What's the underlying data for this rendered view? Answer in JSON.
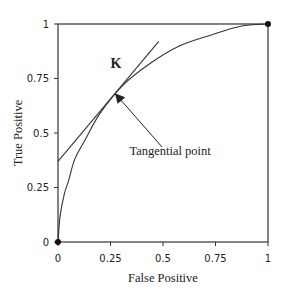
{
  "chart_data": {
    "type": "line",
    "title": "",
    "xlabel": "False Positive",
    "ylabel": "True Positive",
    "xlim": [
      0,
      1
    ],
    "ylim": [
      0,
      1
    ],
    "grid": false,
    "legend": null,
    "xticks": [
      "0",
      "0.25",
      "0.5",
      "0.75",
      "1"
    ],
    "yticks": [
      "0",
      "0.25",
      "0.5",
      "0.75",
      "1"
    ],
    "series": [
      {
        "name": "ROC curve",
        "x": [
          0,
          0.01,
          0.03,
          0.05,
          0.08,
          0.13,
          0.2,
          0.31,
          0.44,
          0.58,
          0.73,
          0.87,
          1.0
        ],
        "y": [
          0,
          0.12,
          0.22,
          0.28,
          0.38,
          0.47,
          0.59,
          0.72,
          0.82,
          0.9,
          0.95,
          0.99,
          1.0
        ]
      },
      {
        "name": "Tangent line",
        "x": [
          0,
          0.48
        ],
        "y": [
          0.37,
          0.92
        ]
      }
    ],
    "markers": [
      {
        "name": "origin",
        "x": 0,
        "y": 0
      },
      {
        "name": "top-right",
        "x": 1,
        "y": 1
      }
    ],
    "annotations": [
      {
        "text": "K",
        "x": 0.25,
        "y": 0.8
      },
      {
        "text": "Tangential point",
        "arrow_to": {
          "x": 0.28,
          "y": 0.67
        },
        "text_pos": {
          "x": 0.34,
          "y": 0.4
        }
      }
    ],
    "tangential_point": {
      "x": 0.31,
      "y": 0.72
    }
  }
}
